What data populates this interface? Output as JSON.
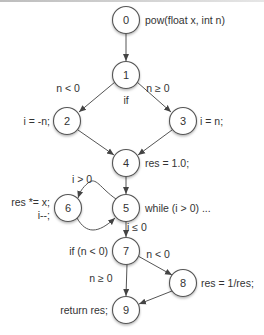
{
  "diagram": {
    "type": "control-flow-graph",
    "nodes": [
      {
        "id": "0",
        "label": "0",
        "x": 126,
        "y": 20,
        "annotation": "pow(float x, int n)",
        "ax": 145,
        "ay": 24,
        "anchor": "start"
      },
      {
        "id": "1",
        "label": "1",
        "x": 126,
        "y": 75,
        "annotation": "if",
        "ax": 126,
        "ay": 104,
        "anchor": "middle"
      },
      {
        "id": "2",
        "label": "2",
        "x": 67,
        "y": 121,
        "annotation": "i = -n;",
        "ax": 50,
        "ay": 125,
        "anchor": "end"
      },
      {
        "id": "3",
        "label": "3",
        "x": 183,
        "y": 121,
        "annotation": "i = n;",
        "ax": 200,
        "ay": 125,
        "anchor": "start"
      },
      {
        "id": "4",
        "label": "4",
        "x": 126,
        "y": 163,
        "annotation": "res = 1.0;",
        "ax": 145,
        "ay": 167,
        "anchor": "start"
      },
      {
        "id": "5",
        "label": "5",
        "x": 126,
        "y": 208,
        "annotation": "while (i  > 0)  ...",
        "ax": 145,
        "ay": 212,
        "anchor": "start"
      },
      {
        "id": "6",
        "label": "6",
        "x": 68,
        "y": 208,
        "annotation": "res *= x;",
        "ax": 50,
        "ay": 206,
        "anchor": "end",
        "annotation2": "i--;",
        "a2x": 50,
        "a2y": 219
      },
      {
        "id": "7",
        "label": "7",
        "x": 126,
        "y": 251,
        "annotation": "if (n < 0)",
        "ax": 108,
        "ay": 255,
        "anchor": "end"
      },
      {
        "id": "8",
        "label": "8",
        "x": 183,
        "y": 283,
        "annotation": "res = 1/res;",
        "ax": 201,
        "ay": 287,
        "anchor": "start"
      },
      {
        "id": "9",
        "label": "9",
        "x": 126,
        "y": 310,
        "annotation": "return res;",
        "ax": 108,
        "ay": 314,
        "anchor": "end"
      }
    ],
    "edges": [
      {
        "from": "0",
        "to": "1",
        "label": ""
      },
      {
        "from": "1",
        "to": "2",
        "label": "n < 0",
        "lx": 68,
        "ly": 92
      },
      {
        "from": "1",
        "to": "3",
        "label": "n ≥ 0",
        "lx": 158,
        "ly": 92
      },
      {
        "from": "2",
        "to": "4",
        "label": ""
      },
      {
        "from": "3",
        "to": "4",
        "label": ""
      },
      {
        "from": "4",
        "to": "5",
        "label": ""
      },
      {
        "from": "5",
        "to": "6",
        "label": "i > 0",
        "lx": 82,
        "ly": 183
      },
      {
        "from": "6",
        "to": "5",
        "label": ""
      },
      {
        "from": "5",
        "to": "7",
        "label": "i ≤ 0",
        "lx": 137,
        "ly": 231
      },
      {
        "from": "7",
        "to": "8",
        "label": "n < 0",
        "lx": 158,
        "ly": 258
      },
      {
        "from": "7",
        "to": "9",
        "label": "n ≥ 0",
        "lx": 101,
        "ly": 282
      },
      {
        "from": "8",
        "to": "9",
        "label": ""
      }
    ]
  },
  "colors": {
    "stroke": "#555555",
    "text": "#333333",
    "background": "#ffffff"
  }
}
